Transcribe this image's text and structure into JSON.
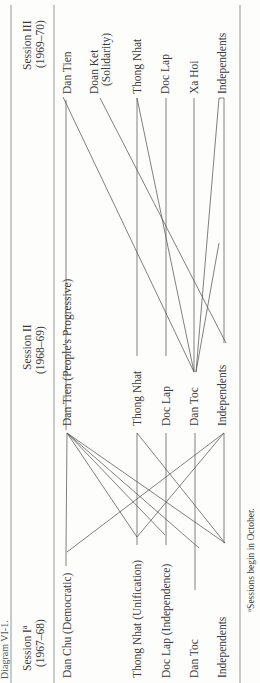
{
  "title_fragment": "Diagram VI-1.",
  "columns": [
    {
      "label": "Session I",
      "superscript": "a",
      "years": "(1967–68)"
    },
    {
      "label": "Session II",
      "years": "(1968–69)"
    },
    {
      "label": "Session III",
      "years": "(1969–70)"
    }
  ],
  "session1": [
    "Dan Chu (Democratic)",
    "Thong Nhat (Unification)",
    "Doc Lap (Independence)",
    "Dan Toc",
    "Independents"
  ],
  "session2": [
    "Dan Tien (People's Progressive)",
    "Thong Nhat",
    "Doc Lap",
    "Dan Toc",
    "Independents"
  ],
  "session3": [
    "Dan Tien",
    "Doan Ket",
    "(Solidarity)",
    "Thong Nhat",
    "Doc Lap",
    "Xa Hoi",
    "Independents"
  ],
  "footnote": {
    "superscript": "a",
    "text": "Sessions begin in October."
  },
  "colors": {
    "ink": "#3a3a3a",
    "rule": "#8a8a8a",
    "edge": "#555555"
  }
}
